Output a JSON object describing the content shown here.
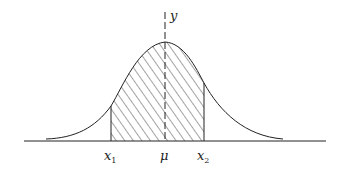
{
  "diagram": {
    "type": "normal-distribution-area",
    "axis_labels": {
      "y": "y"
    },
    "x_labels": [
      {
        "id": "x1",
        "base": "x",
        "sub": "1"
      },
      {
        "id": "mu",
        "base": "μ",
        "sub": ""
      },
      {
        "id": "x2",
        "base": "x",
        "sub": "2"
      }
    ],
    "shaded_region": {
      "from": "x1",
      "to": "x2",
      "pattern": "diagonal-hatch"
    },
    "colors": {
      "stroke": "#222222",
      "background": "#ffffff"
    }
  }
}
